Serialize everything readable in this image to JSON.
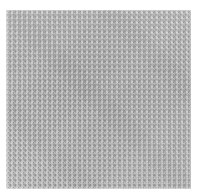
{
  "image": {
    "kind": "texture-swatch",
    "subject": "woven fabric basket weave",
    "width_px": 197,
    "height_px": 196,
    "background_color": "#ffffff",
    "alt_text": "Close-up swatch of light gray woven fabric in a plain basket-weave pattern"
  },
  "swatch": {
    "label": "",
    "left_px": 6,
    "top_px": 10,
    "width_px": 185,
    "height_px": 179,
    "weave_type": "plain-weave",
    "thread_period_px": 5,
    "segment_length_px": 2.5
  },
  "palette": {
    "base": "#c9c9c9",
    "thread_light": "#d6d6d6",
    "thread_light_edge": "#cfcfcf",
    "thread_dark": "#b6b6b6",
    "thread_dark_edge": "#aeaeae",
    "intersection_knot": "#787878",
    "page_background": "#ffffff"
  },
  "layers": [
    {
      "name": "warp-threads",
      "direction": "vertical"
    },
    {
      "name": "weft-threads",
      "direction": "horizontal"
    },
    {
      "name": "interlace-highlight",
      "direction": "diagonal"
    },
    {
      "name": "intersection-knots",
      "direction": "grid"
    },
    {
      "name": "surface-shading",
      "direction": "gradient"
    }
  ]
}
